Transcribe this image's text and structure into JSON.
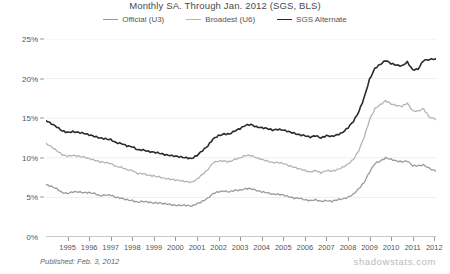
{
  "chart_data": {
    "type": "line",
    "title": "Monthly SA. Through Jan. 2012  (SGS, BLS)",
    "xlabel": "",
    "ylabel": "",
    "ylim": [
      0,
      25
    ],
    "ytick_values": [
      0,
      5,
      10,
      15,
      20,
      25
    ],
    "ytick_labels": [
      "0%",
      "5%",
      "10%",
      "15%",
      "20%",
      "25%"
    ],
    "grid": true,
    "legend_position": "top-center",
    "xlim": [
      1994.0,
      2012.08
    ],
    "xtick_labels": [
      "1995",
      "1996",
      "1997",
      "1998",
      "1999",
      "2000",
      "2001",
      "2002",
      "2003",
      "2004",
      "2005",
      "2006",
      "2007",
      "2008",
      "2009",
      "2010",
      "2011",
      "2012"
    ],
    "xtick_values": [
      1995,
      1996,
      1997,
      1998,
      1999,
      2000,
      2001,
      2002,
      2003,
      2004,
      2005,
      2006,
      2007,
      2008,
      2009,
      2010,
      2011,
      2012
    ],
    "series": [
      {
        "name": "Official (U3)",
        "color": "#9a9a9a",
        "width": 1.3,
        "x": [
          1994.0,
          1994.25,
          1994.5,
          1994.75,
          1995.0,
          1995.25,
          1995.5,
          1995.75,
          1996.0,
          1996.25,
          1996.5,
          1996.75,
          1997.0,
          1997.25,
          1997.5,
          1997.75,
          1998.0,
          1998.25,
          1998.5,
          1998.75,
          1999.0,
          1999.25,
          1999.5,
          1999.75,
          2000.0,
          2000.25,
          2000.5,
          2000.75,
          2001.0,
          2001.25,
          2001.5,
          2001.75,
          2002.0,
          2002.25,
          2002.5,
          2002.75,
          2003.0,
          2003.25,
          2003.5,
          2003.75,
          2004.0,
          2004.25,
          2004.5,
          2004.75,
          2005.0,
          2005.25,
          2005.5,
          2005.75,
          2006.0,
          2006.25,
          2006.5,
          2006.75,
          2007.0,
          2007.25,
          2007.5,
          2007.75,
          2008.0,
          2008.25,
          2008.5,
          2008.75,
          2009.0,
          2009.25,
          2009.5,
          2009.75,
          2010.0,
          2010.25,
          2010.5,
          2010.75,
          2011.0,
          2011.25,
          2011.5,
          2011.75,
          2012.08
        ],
        "values": [
          6.6,
          6.4,
          6.1,
          5.6,
          5.5,
          5.7,
          5.7,
          5.6,
          5.6,
          5.5,
          5.2,
          5.3,
          5.3,
          5.0,
          4.9,
          4.7,
          4.6,
          4.4,
          4.5,
          4.4,
          4.3,
          4.3,
          4.2,
          4.1,
          4.0,
          4.0,
          4.0,
          3.9,
          4.2,
          4.5,
          4.9,
          5.5,
          5.7,
          5.8,
          5.7,
          5.9,
          5.9,
          6.1,
          6.1,
          5.9,
          5.7,
          5.6,
          5.4,
          5.4,
          5.3,
          5.1,
          4.9,
          4.9,
          4.7,
          4.6,
          4.7,
          4.5,
          4.6,
          4.5,
          4.7,
          4.8,
          5.0,
          5.4,
          6.1,
          6.9,
          8.2,
          9.3,
          9.6,
          10.0,
          9.8,
          9.6,
          9.5,
          9.6,
          9.0,
          9.0,
          9.1,
          8.7,
          8.3
        ]
      },
      {
        "name": "Broadest (U6)",
        "color": "#b5b5b5",
        "width": 1.3,
        "x": [
          1994.0,
          1994.25,
          1994.5,
          1994.75,
          1995.0,
          1995.25,
          1995.5,
          1995.75,
          1996.0,
          1996.25,
          1996.5,
          1996.75,
          1997.0,
          1997.25,
          1997.5,
          1997.75,
          1998.0,
          1998.25,
          1998.5,
          1998.75,
          1999.0,
          1999.25,
          1999.5,
          1999.75,
          2000.0,
          2000.25,
          2000.5,
          2000.75,
          2001.0,
          2001.25,
          2001.5,
          2001.75,
          2002.0,
          2002.25,
          2002.5,
          2002.75,
          2003.0,
          2003.25,
          2003.5,
          2003.75,
          2004.0,
          2004.25,
          2004.5,
          2004.75,
          2005.0,
          2005.25,
          2005.5,
          2005.75,
          2006.0,
          2006.25,
          2006.5,
          2006.75,
          2007.0,
          2007.25,
          2007.5,
          2007.75,
          2008.0,
          2008.25,
          2008.5,
          2008.75,
          2009.0,
          2009.25,
          2009.5,
          2009.75,
          2010.0,
          2010.25,
          2010.5,
          2010.75,
          2011.0,
          2011.25,
          2011.5,
          2011.75,
          2012.08
        ],
        "values": [
          11.8,
          11.4,
          10.9,
          10.4,
          10.2,
          10.3,
          10.2,
          10.1,
          9.9,
          9.7,
          9.5,
          9.4,
          9.3,
          8.9,
          8.8,
          8.5,
          8.4,
          8.0,
          8.0,
          7.8,
          7.7,
          7.6,
          7.4,
          7.3,
          7.2,
          7.1,
          7.0,
          6.9,
          7.3,
          7.9,
          8.5,
          9.4,
          9.6,
          9.6,
          9.5,
          9.8,
          10.0,
          10.3,
          10.3,
          10.0,
          9.8,
          9.6,
          9.4,
          9.4,
          9.3,
          9.0,
          8.8,
          8.6,
          8.4,
          8.2,
          8.4,
          8.1,
          8.4,
          8.3,
          8.5,
          8.8,
          9.2,
          9.8,
          10.9,
          12.6,
          14.8,
          16.2,
          16.7,
          17.2,
          16.8,
          16.6,
          16.5,
          16.9,
          15.9,
          15.9,
          16.2,
          15.2,
          14.8
        ]
      },
      {
        "name": "SGS Alternate",
        "color": "#2b2b2b",
        "width": 1.6,
        "x": [
          1994.0,
          1994.25,
          1994.5,
          1994.75,
          1995.0,
          1995.25,
          1995.5,
          1995.75,
          1996.0,
          1996.25,
          1996.5,
          1996.75,
          1997.0,
          1997.25,
          1997.5,
          1997.75,
          1998.0,
          1998.25,
          1998.5,
          1998.75,
          1999.0,
          1999.25,
          1999.5,
          1999.75,
          2000.0,
          2000.25,
          2000.5,
          2000.75,
          2001.0,
          2001.25,
          2001.5,
          2001.75,
          2002.0,
          2002.25,
          2002.5,
          2002.75,
          2003.0,
          2003.25,
          2003.5,
          2003.75,
          2004.0,
          2004.25,
          2004.5,
          2004.75,
          2005.0,
          2005.25,
          2005.5,
          2005.75,
          2006.0,
          2006.25,
          2006.5,
          2006.75,
          2007.0,
          2007.25,
          2007.5,
          2007.75,
          2008.0,
          2008.25,
          2008.5,
          2008.75,
          2009.0,
          2009.25,
          2009.5,
          2009.75,
          2010.0,
          2010.25,
          2010.5,
          2010.75,
          2011.0,
          2011.25,
          2011.5,
          2011.75,
          2012.08
        ],
        "values": [
          14.7,
          14.3,
          13.9,
          13.4,
          13.2,
          13.3,
          13.2,
          13.1,
          12.9,
          12.7,
          12.5,
          12.4,
          12.3,
          11.9,
          11.8,
          11.5,
          11.4,
          11.0,
          11.0,
          10.8,
          10.7,
          10.6,
          10.4,
          10.3,
          10.2,
          10.1,
          10.0,
          9.9,
          10.3,
          10.9,
          11.5,
          12.4,
          12.8,
          13.0,
          13.0,
          13.4,
          13.7,
          14.1,
          14.2,
          13.9,
          13.8,
          13.7,
          13.5,
          13.6,
          13.5,
          13.3,
          13.1,
          12.9,
          12.8,
          12.6,
          12.8,
          12.5,
          12.8,
          12.7,
          12.9,
          13.2,
          13.8,
          14.6,
          15.8,
          17.6,
          19.9,
          21.3,
          21.8,
          22.3,
          21.9,
          21.7,
          21.6,
          22.1,
          21.1,
          21.2,
          22.3,
          22.4,
          22.5
        ]
      }
    ]
  },
  "footer": {
    "published": "Published: Feb. 3, 2012",
    "watermark": "shadowstats.com"
  },
  "colors": {
    "grid": "#eeeeee",
    "axis": "#8f8f8f",
    "text": "#555555"
  }
}
